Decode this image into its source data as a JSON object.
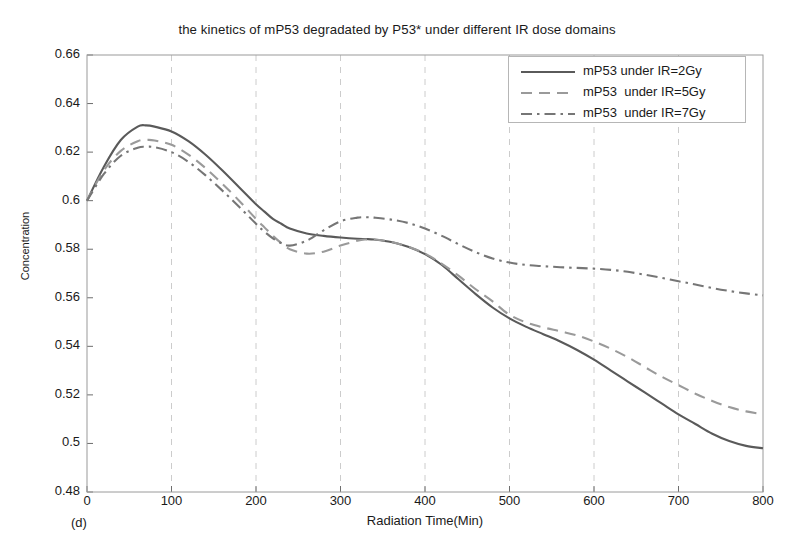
{
  "chart_data": {
    "type": "line",
    "title": "the kinetics of mP53 degradated by P53* under different IR dose domains",
    "subfigure_label": "(d)",
    "xlabel": "Radiation Time(Min)",
    "ylabel": "Concentration",
    "xlim": [
      0,
      800
    ],
    "ylim": [
      0.48,
      0.66
    ],
    "xticks": [
      0,
      100,
      200,
      300,
      400,
      500,
      600,
      700,
      800
    ],
    "xtick_labels": [
      "0",
      "100",
      "200",
      "300",
      "400",
      "500",
      "600",
      "700",
      "800"
    ],
    "yticks": [
      0.48,
      0.5,
      0.52,
      0.54,
      0.56,
      0.58,
      0.6,
      0.62,
      0.64,
      0.66
    ],
    "ytick_labels": [
      "0.48",
      "0.5",
      "0.52",
      "0.54",
      "0.56",
      "0.58",
      "0.6",
      "0.62",
      "0.64",
      "0.66"
    ],
    "grid": {
      "vertical": true,
      "horizontal": false,
      "style": "dashed",
      "color": "#cccccc"
    },
    "legend_position": "upper right",
    "x": [
      0,
      20,
      40,
      60,
      70,
      80,
      100,
      120,
      140,
      160,
      180,
      200,
      210,
      220,
      230,
      240,
      260,
      280,
      300,
      320,
      330,
      340,
      360,
      380,
      400,
      420,
      440,
      460,
      480,
      500,
      520,
      540,
      560,
      580,
      600,
      620,
      640,
      660,
      680,
      700,
      720,
      740,
      760,
      780,
      800
    ],
    "series": [
      {
        "name": "mP53 under IR=2Gy",
        "dose": "2Gy",
        "linestyle": "solid",
        "color": "#5a5a5a",
        "values": [
          0.6,
          0.614,
          0.625,
          0.6305,
          0.631,
          0.6305,
          0.6285,
          0.6245,
          0.619,
          0.6125,
          0.6055,
          0.5985,
          0.5955,
          0.5925,
          0.5905,
          0.5885,
          0.5865,
          0.5855,
          0.5848,
          0.5843,
          0.5842,
          0.584,
          0.583,
          0.581,
          0.578,
          0.5735,
          0.5675,
          0.5615,
          0.556,
          0.5515,
          0.548,
          0.545,
          0.542,
          0.5385,
          0.5345,
          0.53,
          0.5255,
          0.521,
          0.5165,
          0.512,
          0.508,
          0.504,
          0.501,
          0.499,
          0.498
        ]
      },
      {
        "name": "mP53  under IR=5Gy",
        "dose": "5Gy",
        "linestyle": "dashed",
        "color": "#9a9a9a",
        "values": [
          0.6,
          0.6125,
          0.6205,
          0.6245,
          0.625,
          0.6248,
          0.623,
          0.619,
          0.6135,
          0.607,
          0.6,
          0.5925,
          0.589,
          0.5855,
          0.5825,
          0.58,
          0.5782,
          0.579,
          0.5815,
          0.5835,
          0.584,
          0.584,
          0.583,
          0.581,
          0.5782,
          0.574,
          0.569,
          0.5635,
          0.5585,
          0.553,
          0.5498,
          0.5478,
          0.5462,
          0.5445,
          0.542,
          0.539,
          0.5355,
          0.5315,
          0.5275,
          0.524,
          0.5205,
          0.5175,
          0.515,
          0.5132,
          0.512
        ]
      },
      {
        "name": "mP53  under IR=7Gy",
        "dose": "7Gy",
        "linestyle": "dashdot",
        "color": "#767676",
        "values": [
          0.6,
          0.611,
          0.6185,
          0.6218,
          0.6222,
          0.622,
          0.62,
          0.616,
          0.6105,
          0.6042,
          0.5975,
          0.5905,
          0.5872,
          0.5845,
          0.5825,
          0.5815,
          0.5835,
          0.5878,
          0.5915,
          0.593,
          0.5932,
          0.593,
          0.5922,
          0.5908,
          0.5885,
          0.5855,
          0.582,
          0.5788,
          0.5762,
          0.5745,
          0.5735,
          0.573,
          0.5726,
          0.5723,
          0.572,
          0.5715,
          0.5707,
          0.5695,
          0.5682,
          0.5668,
          0.5655,
          0.564,
          0.5628,
          0.5618,
          0.561
        ]
      }
    ]
  },
  "legend": {
    "entries": [
      {
        "label": "mP53 under IR=2Gy"
      },
      {
        "label": "mP53  under IR=5Gy"
      },
      {
        "label": "mP53  under IR=7Gy"
      }
    ]
  }
}
